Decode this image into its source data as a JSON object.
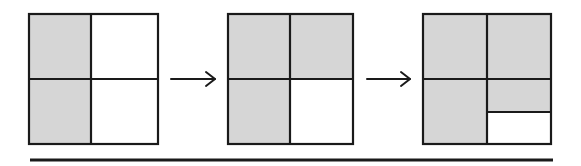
{
  "diagram": {
    "type": "sequence-of-grids",
    "colors": {
      "shaded": "#d6d6d6",
      "empty": "#ffffff",
      "line": "#1a1a1a"
    },
    "steps": [
      {
        "id": "step-1",
        "box": {
          "x": 29,
          "y": 14,
          "w": 129,
          "h": 130
        },
        "cells": [
          {
            "pos": "top-left",
            "shaded": true
          },
          {
            "pos": "top-right",
            "shaded": false
          },
          {
            "pos": "bottom-left",
            "shaded": true
          },
          {
            "pos": "bottom-right",
            "shaded": false
          }
        ],
        "shaded_fraction": "2/4"
      },
      {
        "id": "step-2",
        "box": {
          "x": 228,
          "y": 14,
          "w": 125,
          "h": 130
        },
        "cells": [
          {
            "pos": "top-left",
            "shaded": true
          },
          {
            "pos": "top-right",
            "shaded": true
          },
          {
            "pos": "bottom-left",
            "shaded": true
          },
          {
            "pos": "bottom-right",
            "shaded": false
          }
        ],
        "shaded_fraction": "3/4"
      },
      {
        "id": "step-3",
        "box": {
          "x": 423,
          "y": 14,
          "w": 128,
          "h": 130
        },
        "cells": [
          {
            "pos": "top-left",
            "shaded": true
          },
          {
            "pos": "top-right",
            "shaded": true
          },
          {
            "pos": "bottom-left",
            "shaded": true
          },
          {
            "pos": "bottom-right-upper-half",
            "shaded": true
          },
          {
            "pos": "bottom-right-lower-half",
            "shaded": false
          }
        ],
        "shaded_fraction": "7/8"
      }
    ],
    "arrows": [
      {
        "from": "step-1",
        "to": "step-2"
      },
      {
        "from": "step-2",
        "to": "step-3"
      }
    ],
    "baseline": {
      "present": true
    }
  }
}
